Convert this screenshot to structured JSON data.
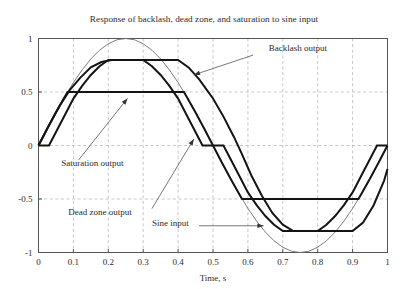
{
  "chart_data": {
    "type": "line",
    "title": "Response of backlash, dead zone, and saturation to sine input",
    "xlabel": "Time, s",
    "ylabel": "",
    "xlim": [
      0,
      1
    ],
    "ylim": [
      -1,
      1
    ],
    "xticks": [
      "0",
      "0.1",
      "0.2",
      "0.3",
      "0.4",
      "0.5",
      "0.6",
      "0.7",
      "0.8",
      "0.9",
      "1"
    ],
    "xtick_values": [
      0,
      0.1,
      0.2,
      0.3,
      0.4,
      0.5,
      0.6,
      0.7,
      0.8,
      0.9,
      1
    ],
    "yticks": [
      "1",
      "0.5",
      "0",
      "-0.5",
      "-1"
    ],
    "ytick_values": [
      1,
      0.5,
      0,
      -0.5,
      -1
    ],
    "grid": true,
    "grid_style": "dashed",
    "grid_color": "#b9b9b9",
    "frame_color": "#555555",
    "legend_position": "inline-annotations",
    "series": [
      {
        "name": "Sine input",
        "kind": "sine",
        "color": "#6e6e6e",
        "line_width": 0.9,
        "amplitude": 1,
        "period": 1,
        "phase": 0,
        "points": [
          [
            0,
            0
          ],
          [
            0.025,
            0.156
          ],
          [
            0.05,
            0.309
          ],
          [
            0.075,
            0.454
          ],
          [
            0.1,
            0.588
          ],
          [
            0.125,
            0.707
          ],
          [
            0.15,
            0.809
          ],
          [
            0.175,
            0.891
          ],
          [
            0.2,
            0.951
          ],
          [
            0.225,
            0.988
          ],
          [
            0.25,
            1.0
          ],
          [
            0.275,
            0.988
          ],
          [
            0.3,
            0.951
          ],
          [
            0.325,
            0.891
          ],
          [
            0.35,
            0.809
          ],
          [
            0.375,
            0.707
          ],
          [
            0.4,
            0.588
          ],
          [
            0.425,
            0.454
          ],
          [
            0.45,
            0.309
          ],
          [
            0.475,
            0.156
          ],
          [
            0.5,
            0
          ],
          [
            0.525,
            -0.156
          ],
          [
            0.55,
            -0.309
          ],
          [
            0.575,
            -0.454
          ],
          [
            0.6,
            -0.588
          ],
          [
            0.625,
            -0.707
          ],
          [
            0.65,
            -0.809
          ],
          [
            0.675,
            -0.891
          ],
          [
            0.7,
            -0.951
          ],
          [
            0.725,
            -0.988
          ],
          [
            0.75,
            -1.0
          ],
          [
            0.775,
            -0.988
          ],
          [
            0.8,
            -0.951
          ],
          [
            0.825,
            -0.891
          ],
          [
            0.85,
            -0.809
          ],
          [
            0.875,
            -0.707
          ],
          [
            0.9,
            -0.588
          ],
          [
            0.925,
            -0.454
          ],
          [
            0.95,
            -0.309
          ],
          [
            0.975,
            -0.156
          ],
          [
            1,
            0
          ]
        ]
      },
      {
        "name": "Saturation output",
        "kind": "saturation",
        "color": "#141414",
        "line_width": 2.0,
        "saturation_level": 0.5,
        "points": [
          [
            0,
            0
          ],
          [
            0.025,
            0.156
          ],
          [
            0.05,
            0.309
          ],
          [
            0.075,
            0.454
          ],
          [
            0.0833,
            0.5
          ],
          [
            0.4167,
            0.5
          ],
          [
            0.425,
            0.454
          ],
          [
            0.45,
            0.309
          ],
          [
            0.475,
            0.156
          ],
          [
            0.5,
            0
          ],
          [
            0.525,
            -0.156
          ],
          [
            0.55,
            -0.309
          ],
          [
            0.575,
            -0.454
          ],
          [
            0.5833,
            -0.5
          ],
          [
            0.9167,
            -0.5
          ],
          [
            0.925,
            -0.454
          ],
          [
            0.95,
            -0.309
          ],
          [
            0.975,
            -0.156
          ],
          [
            1,
            0
          ]
        ]
      },
      {
        "name": "Dead zone output",
        "kind": "deadzone-saturation",
        "color": "#141414",
        "line_width": 2.0,
        "deadband": 0.15,
        "clip_level": 0.8,
        "points": [
          [
            0,
            0
          ],
          [
            0.03,
            0
          ],
          [
            0.07,
            0.25
          ],
          [
            0.1,
            0.438
          ],
          [
            0.125,
            0.557
          ],
          [
            0.15,
            0.659
          ],
          [
            0.175,
            0.741
          ],
          [
            0.2,
            0.8
          ],
          [
            0.25,
            0.8
          ],
          [
            0.3,
            0.8
          ],
          [
            0.325,
            0.741
          ],
          [
            0.35,
            0.659
          ],
          [
            0.375,
            0.557
          ],
          [
            0.4,
            0.438
          ],
          [
            0.43,
            0.25
          ],
          [
            0.47,
            0
          ],
          [
            0.53,
            0
          ],
          [
            0.57,
            -0.25
          ],
          [
            0.6,
            -0.438
          ],
          [
            0.625,
            -0.557
          ],
          [
            0.65,
            -0.659
          ],
          [
            0.675,
            -0.741
          ],
          [
            0.7,
            -0.8
          ],
          [
            0.75,
            -0.8
          ],
          [
            0.8,
            -0.8
          ],
          [
            0.825,
            -0.741
          ],
          [
            0.85,
            -0.659
          ],
          [
            0.875,
            -0.557
          ],
          [
            0.9,
            -0.438
          ],
          [
            0.93,
            -0.25
          ],
          [
            0.97,
            0
          ],
          [
            1,
            0
          ]
        ]
      },
      {
        "name": "Backlash output",
        "kind": "backlash",
        "color": "#141414",
        "line_width": 2.0,
        "clip_level": 0.8,
        "lag": 0.03,
        "points": [
          [
            0,
            0
          ],
          [
            0.03,
            0.19
          ],
          [
            0.06,
            0.37
          ],
          [
            0.09,
            0.52
          ],
          [
            0.12,
            0.634
          ],
          [
            0.15,
            0.73
          ],
          [
            0.18,
            0.78
          ],
          [
            0.21,
            0.8
          ],
          [
            0.26,
            0.8
          ],
          [
            0.33,
            0.8
          ],
          [
            0.4,
            0.8
          ],
          [
            0.43,
            0.73
          ],
          [
            0.46,
            0.62
          ],
          [
            0.5,
            0.44
          ],
          [
            0.53,
            0.27
          ],
          [
            0.56,
            0.08
          ],
          [
            0.58,
            -0.06
          ],
          [
            0.61,
            -0.28
          ],
          [
            0.64,
            -0.47
          ],
          [
            0.67,
            -0.63
          ],
          [
            0.7,
            -0.74
          ],
          [
            0.73,
            -0.8
          ],
          [
            0.78,
            -0.8
          ],
          [
            0.85,
            -0.8
          ],
          [
            0.9,
            -0.8
          ],
          [
            0.93,
            -0.72
          ],
          [
            0.96,
            -0.56
          ],
          [
            0.99,
            -0.33
          ],
          [
            1,
            -0.22
          ]
        ]
      }
    ],
    "annotations": [
      {
        "name": "backlash-output",
        "text": "Backlash output",
        "text_x": 0.66,
        "text_y": 0.88,
        "arrow_from_x": 0.615,
        "arrow_from_y": 0.845,
        "arrow_to_x": 0.445,
        "arrow_to_y": 0.66,
        "arrow": true
      },
      {
        "name": "saturation-output",
        "text": "Saturation output",
        "text_x": 0.065,
        "text_y": -0.19,
        "arrow_from_x": 0.115,
        "arrow_from_y": -0.135,
        "arrow_to_x": 0.255,
        "arrow_to_y": 0.44,
        "arrow": true
      },
      {
        "name": "dead-zone-output",
        "text": "Dead  zone output",
        "text_x": 0.085,
        "text_y": -0.645,
        "arrow_from_x": 0.325,
        "arrow_from_y": -0.59,
        "arrow_to_x": 0.445,
        "arrow_to_y": 0.06,
        "arrow": true
      },
      {
        "name": "sine-input",
        "text": "Sine input",
        "text_x": 0.325,
        "text_y": -0.75,
        "arrow_from_x": 0.46,
        "arrow_from_y": -0.75,
        "arrow_to_x": 0.645,
        "arrow_to_y": -0.75,
        "arrow": true
      }
    ]
  }
}
